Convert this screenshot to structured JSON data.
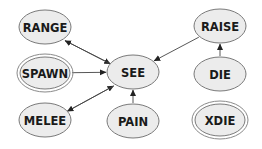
{
  "diagram": {
    "nodes": [
      {
        "id": "RANGE",
        "label": "RANGE",
        "double": false
      },
      {
        "id": "SPAWN",
        "label": "SPAWN",
        "double": true
      },
      {
        "id": "MELEE",
        "label": "MELEE",
        "double": false
      },
      {
        "id": "SEE",
        "label": "SEE",
        "double": false
      },
      {
        "id": "PAIN",
        "label": "PAIN",
        "double": false
      },
      {
        "id": "RAISE",
        "label": "RAISE",
        "double": false
      },
      {
        "id": "DIE",
        "label": "DIE",
        "double": false
      },
      {
        "id": "XDIE",
        "label": "XDIE",
        "double": true
      }
    ],
    "edges": [
      {
        "from": "RANGE",
        "to": "SEE"
      },
      {
        "from": "SEE",
        "to": "RANGE"
      },
      {
        "from": "SPAWN",
        "to": "SEE"
      },
      {
        "from": "MELEE",
        "to": "SEE"
      },
      {
        "from": "SEE",
        "to": "MELEE"
      },
      {
        "from": "PAIN",
        "to": "SEE"
      },
      {
        "from": "RAISE",
        "to": "SEE"
      },
      {
        "from": "DIE",
        "to": "RAISE"
      }
    ]
  }
}
